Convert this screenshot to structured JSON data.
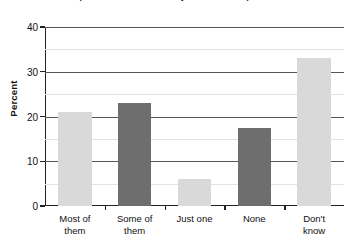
{
  "chart_data": {
    "type": "bar",
    "title": "September 11 attacks: the hijackers were Iraqi citizens",
    "title_clipped": true,
    "xlabel": "",
    "ylabel": "Percent",
    "categories": [
      "Most of\nthem",
      "Some of\nthem",
      "Just one",
      "None",
      "Don't\nknow"
    ],
    "values": [
      21,
      23,
      6,
      17.5,
      33
    ],
    "ylim": [
      0,
      40
    ],
    "yticks": [
      0,
      10,
      20,
      30,
      40
    ],
    "ytick_labels": [
      "0",
      "10",
      "20",
      "30",
      "40"
    ],
    "grid": true,
    "legend": "none",
    "bar_colors": [
      "#d9d9d9",
      "#6e6e6e",
      "#d9d9d9",
      "#6e6e6e",
      "#d9d9d9"
    ]
  },
  "colors": {
    "light_bar": "#d9d9d9",
    "dark_bar": "#6e6e6e",
    "axis": "#222222",
    "gridline": "#555555",
    "background": "#ffffff"
  }
}
